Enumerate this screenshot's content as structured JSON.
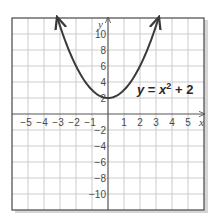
{
  "chart_data": {
    "type": "line",
    "title": "",
    "xlabel": "x",
    "ylabel": "y",
    "xlim": [
      -6,
      6
    ],
    "ylim": [
      -12,
      12
    ],
    "grid": true,
    "x_ticks": [
      -5,
      -4,
      -3,
      -2,
      -1,
      1,
      2,
      3,
      4,
      5
    ],
    "x_tick_labels": [
      "−5",
      "−4",
      "−3",
      "−2",
      "−1",
      "1",
      "2",
      "3",
      "4",
      "5"
    ],
    "y_ticks": [
      10,
      8,
      6,
      4,
      2,
      -2,
      -4,
      -6,
      -8,
      -10
    ],
    "y_tick_labels": [
      "10",
      "8",
      "6",
      "4",
      "2",
      "−2",
      "−4",
      "−6",
      "−8",
      "−10"
    ],
    "series": [
      {
        "name": "y = x² + 2",
        "function": "x^2 + 2",
        "x": [
          -3.16,
          -3,
          -2,
          -1,
          0,
          1,
          2,
          3,
          3.16
        ],
        "y": [
          12,
          11,
          6,
          3,
          2,
          3,
          6,
          11,
          12
        ],
        "arrows_at_ends": true,
        "color": "#3a3a3a"
      }
    ],
    "annotations": [
      {
        "text": "y = x² + 2",
        "x": 3.6,
        "y": 3.2
      }
    ],
    "legend": "none"
  },
  "labels": {
    "x_axis": "x",
    "y_axis": "y",
    "equation_y": "y",
    "equation_eq": " = ",
    "equation_x": "x",
    "equation_exp": "2",
    "equation_rest": " + 2"
  },
  "colors": {
    "grid": "#c8c8c8",
    "axis": "#555555",
    "frame": "#555555",
    "curve": "#3a3a3a",
    "shadow": "#bdbdbd"
  }
}
